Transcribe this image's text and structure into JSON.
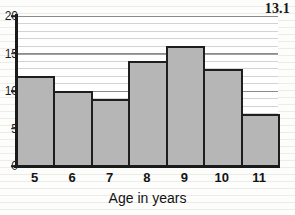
{
  "figure": {
    "label": "13.1"
  },
  "chart_data": {
    "type": "bar",
    "title": "",
    "subtitle": "",
    "xlabel": "Age in years",
    "ylabel": "",
    "categories": [
      "5",
      "6",
      "7",
      "8",
      "9",
      "10",
      "11"
    ],
    "values": [
      12,
      10,
      9,
      14,
      16,
      13,
      7
    ],
    "series": [
      {
        "name": "Frequency",
        "values": [
          12,
          10,
          9,
          14,
          16,
          13,
          7
        ]
      }
    ],
    "ylim": [
      0,
      20
    ],
    "xlim_categories": [
      "5",
      "11"
    ],
    "y_ticks": [
      0,
      5,
      10,
      15,
      20
    ],
    "y_tick_labels": [
      "0",
      "5",
      "10",
      "15",
      "20"
    ],
    "y_minor_tick_step": 1,
    "grid": true,
    "grid_axis": "y",
    "legend": false,
    "legend_position": "none",
    "bar_fill_color": "#b6b6b6",
    "bar_edge_color": "#1e1e1e",
    "bar_gap": 0,
    "annotations": []
  },
  "axis": {
    "y_tick_labels": [
      "20",
      "15",
      "10",
      "5",
      "0"
    ],
    "x_tick_labels": [
      "5",
      "6",
      "7",
      "8",
      "9",
      "10",
      "11"
    ],
    "x_title": "Age in years"
  },
  "colors": {
    "bar_fill": "#b6b6b6",
    "bar_edge": "#1e1e1e",
    "axis": "#1b1b1b",
    "grid": "#6e6e6e",
    "paper": "#fdfdfb",
    "text": "#141414"
  }
}
